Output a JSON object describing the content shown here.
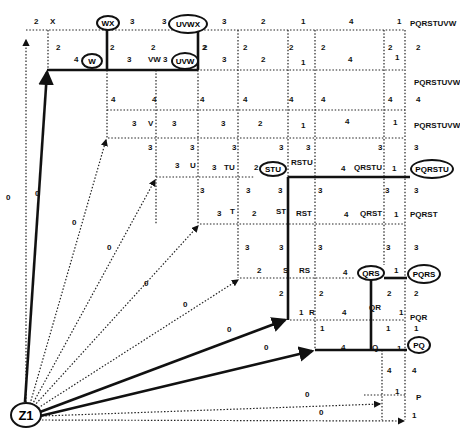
{
  "diagram": {
    "root": "Z1",
    "highlighted_nodes": [
      "W",
      "WX",
      "UVW",
      "UVWX",
      "STU",
      "PQRSTU",
      "QRS",
      "PQRS",
      "PQ"
    ],
    "labels": [
      {
        "t": "2",
        "x": 34,
        "y": 24
      },
      {
        "t": "X",
        "x": 50,
        "y": 24
      },
      {
        "t": "3",
        "x": 130,
        "y": 24
      },
      {
        "t": "3",
        "x": 162,
        "y": 24
      },
      {
        "t": "3",
        "x": 222,
        "y": 24
      },
      {
        "t": "2",
        "x": 261,
        "y": 24
      },
      {
        "t": "1",
        "x": 301,
        "y": 24
      },
      {
        "t": "4",
        "x": 349,
        "y": 24
      },
      {
        "t": "1",
        "x": 397,
        "y": 24
      },
      {
        "t": "PQRSTUVW",
        "x": 410,
        "y": 26
      },
      {
        "t": "2",
        "x": 56,
        "y": 50
      },
      {
        "t": "4",
        "x": 74,
        "y": 62
      },
      {
        "t": "2",
        "x": 110,
        "y": 50
      },
      {
        "t": "3",
        "x": 127,
        "y": 62
      },
      {
        "t": "VW",
        "x": 148,
        "y": 62
      },
      {
        "t": "2",
        "x": 151,
        "y": 50
      },
      {
        "t": "3",
        "x": 163,
        "y": 62
      },
      {
        "t": "2",
        "x": 202,
        "y": 50
      },
      {
        "t": "3",
        "x": 222,
        "y": 62
      },
      {
        "t": "2",
        "x": 203,
        "y": 50
      },
      {
        "t": "2",
        "x": 243,
        "y": 50
      },
      {
        "t": "2",
        "x": 261,
        "y": 62
      },
      {
        "t": "2",
        "x": 289,
        "y": 50
      },
      {
        "t": "1",
        "x": 301,
        "y": 65
      },
      {
        "t": "2",
        "x": 321,
        "y": 50
      },
      {
        "t": "4",
        "x": 348,
        "y": 62
      },
      {
        "t": "2",
        "x": 388,
        "y": 50
      },
      {
        "t": "1",
        "x": 395,
        "y": 60
      },
      {
        "t": "2",
        "x": 416,
        "y": 50
      },
      {
        "t": "PQRSTUVW",
        "x": 414,
        "y": 85
      },
      {
        "t": "4",
        "x": 111,
        "y": 102
      },
      {
        "t": "4",
        "x": 152,
        "y": 102
      },
      {
        "t": "4",
        "x": 200,
        "y": 102
      },
      {
        "t": "4",
        "x": 243,
        "y": 102
      },
      {
        "t": "4",
        "x": 289,
        "y": 102
      },
      {
        "t": "4",
        "x": 321,
        "y": 102
      },
      {
        "t": "4",
        "x": 388,
        "y": 102
      },
      {
        "t": "4",
        "x": 416,
        "y": 102
      },
      {
        "t": "3",
        "x": 132,
        "y": 126
      },
      {
        "t": "V",
        "x": 148,
        "y": 126
      },
      {
        "t": "3",
        "x": 172,
        "y": 126
      },
      {
        "t": "3",
        "x": 221,
        "y": 126
      },
      {
        "t": "2",
        "x": 258,
        "y": 126
      },
      {
        "t": "1",
        "x": 301,
        "y": 128
      },
      {
        "t": "4",
        "x": 345,
        "y": 124
      },
      {
        "t": "1",
        "x": 393,
        "y": 125
      },
      {
        "t": "PQRSTUVW",
        "x": 414,
        "y": 128
      },
      {
        "t": "3",
        "x": 148,
        "y": 150
      },
      {
        "t": "3",
        "x": 190,
        "y": 150
      },
      {
        "t": "3",
        "x": 232,
        "y": 150
      },
      {
        "t": "3",
        "x": 279,
        "y": 150
      },
      {
        "t": "3",
        "x": 306,
        "y": 150
      },
      {
        "t": "3",
        "x": 378,
        "y": 150
      },
      {
        "t": "3",
        "x": 414,
        "y": 150
      },
      {
        "t": "3",
        "x": 175,
        "y": 168
      },
      {
        "t": "U",
        "x": 190,
        "y": 168
      },
      {
        "t": "3",
        "x": 212,
        "y": 170
      },
      {
        "t": "TU",
        "x": 224,
        "y": 170
      },
      {
        "t": "2",
        "x": 254,
        "y": 170
      },
      {
        "t": "RSTU",
        "x": 291,
        "y": 165
      },
      {
        "t": "4",
        "x": 341,
        "y": 171
      },
      {
        "t": "QRSTU",
        "x": 354,
        "y": 170
      },
      {
        "t": "1",
        "x": 392,
        "y": 171
      },
      {
        "t": "3",
        "x": 200,
        "y": 193
      },
      {
        "t": "3",
        "x": 246,
        "y": 193
      },
      {
        "t": "3",
        "x": 278,
        "y": 193
      },
      {
        "t": "3",
        "x": 318,
        "y": 193
      },
      {
        "t": "3",
        "x": 385,
        "y": 193
      },
      {
        "t": "3",
        "x": 414,
        "y": 193
      },
      {
        "t": "3",
        "x": 217,
        "y": 216
      },
      {
        "t": "T",
        "x": 230,
        "y": 214
      },
      {
        "t": "2",
        "x": 252,
        "y": 216
      },
      {
        "t": "ST",
        "x": 276,
        "y": 214
      },
      {
        "t": "RST",
        "x": 296,
        "y": 216
      },
      {
        "t": "4",
        "x": 344,
        "y": 217
      },
      {
        "t": "QRST",
        "x": 360,
        "y": 216
      },
      {
        "t": "1",
        "x": 394,
        "y": 217
      },
      {
        "t": "PQRST",
        "x": 410,
        "y": 217
      },
      {
        "t": "3",
        "x": 245,
        "y": 250
      },
      {
        "t": "3",
        "x": 279,
        "y": 250
      },
      {
        "t": "3",
        "x": 318,
        "y": 250
      },
      {
        "t": "3",
        "x": 386,
        "y": 250
      },
      {
        "t": "3",
        "x": 414,
        "y": 250
      },
      {
        "t": "2",
        "x": 257,
        "y": 273
      },
      {
        "t": "S",
        "x": 283,
        "y": 273
      },
      {
        "t": "RS",
        "x": 299,
        "y": 273
      },
      {
        "t": "4",
        "x": 343,
        "y": 275
      },
      {
        "t": "1",
        "x": 394,
        "y": 273
      },
      {
        "t": "2",
        "x": 279,
        "y": 296
      },
      {
        "t": "2",
        "x": 319,
        "y": 296
      },
      {
        "t": "2",
        "x": 387,
        "y": 296
      },
      {
        "t": "2",
        "x": 414,
        "y": 296
      },
      {
        "t": "0",
        "x": 183,
        "y": 307
      },
      {
        "t": "1",
        "x": 299,
        "y": 315
      },
      {
        "t": "R",
        "x": 309,
        "y": 315
      },
      {
        "t": "4",
        "x": 342,
        "y": 315
      },
      {
        "t": "QR",
        "x": 369,
        "y": 310
      },
      {
        "t": "1",
        "x": 399,
        "y": 315
      },
      {
        "t": "PQR",
        "x": 410,
        "y": 320
      },
      {
        "t": "1",
        "x": 320,
        "y": 331
      },
      {
        "t": "1",
        "x": 386,
        "y": 331
      },
      {
        "t": "1",
        "x": 414,
        "y": 331
      },
      {
        "t": "0",
        "x": 227,
        "y": 332
      },
      {
        "t": "0",
        "x": 264,
        "y": 350
      },
      {
        "t": "4",
        "x": 341,
        "y": 350
      },
      {
        "t": "Q",
        "x": 372,
        "y": 350
      },
      {
        "t": "1",
        "x": 397,
        "y": 351
      },
      {
        "t": "4",
        "x": 387,
        "y": 373
      },
      {
        "t": "4",
        "x": 412,
        "y": 373
      },
      {
        "t": "0",
        "x": 305,
        "y": 397
      },
      {
        "t": "1",
        "x": 395,
        "y": 394
      },
      {
        "t": "P",
        "x": 416,
        "y": 400
      },
      {
        "t": "0",
        "x": 319,
        "y": 415
      },
      {
        "t": "1",
        "x": 412,
        "y": 418
      },
      {
        "t": "0",
        "x": 6,
        "y": 200
      },
      {
        "t": "0",
        "x": 35,
        "y": 196
      },
      {
        "t": "0",
        "x": 72,
        "y": 225
      },
      {
        "t": "0",
        "x": 107,
        "y": 250
      },
      {
        "t": "0",
        "x": 144,
        "y": 286
      }
    ],
    "nodes": [
      {
        "t": "WX",
        "x": 96,
        "y": 15,
        "w": 24,
        "h": 16
      },
      {
        "t": "UVWX",
        "x": 168,
        "y": 14,
        "w": 40,
        "h": 20
      },
      {
        "t": "W",
        "x": 81,
        "y": 53,
        "w": 22,
        "h": 16
      },
      {
        "t": "UVW",
        "x": 171,
        "y": 52,
        "w": 28,
        "h": 18
      },
      {
        "t": "STU",
        "x": 259,
        "y": 161,
        "w": 28,
        "h": 16
      },
      {
        "t": "PQRSTU",
        "x": 410,
        "y": 159,
        "w": 44,
        "h": 20
      },
      {
        "t": "QRS",
        "x": 357,
        "y": 265,
        "w": 28,
        "h": 16
      },
      {
        "t": "PQRS",
        "x": 407,
        "y": 264,
        "w": 34,
        "h": 20
      },
      {
        "t": "PQ",
        "x": 407,
        "y": 336,
        "w": 24,
        "h": 18
      },
      {
        "t": "Z1",
        "x": 10,
        "y": 402,
        "w": 32,
        "h": 26
      }
    ]
  }
}
